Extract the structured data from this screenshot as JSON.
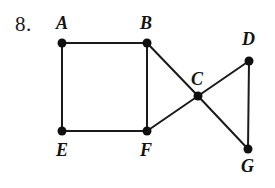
{
  "figure": {
    "width": 275,
    "height": 188,
    "background_color": "#ffffff",
    "ink_color": "#1a1a1a",
    "problem_number": "8."
  },
  "graph": {
    "edge_color": "#1a1a1a",
    "edge_width": 2,
    "vertex_color": "#101010",
    "vertex_radius": 4.5,
    "vertices": [
      {
        "id": "A",
        "label": "A",
        "x": 62,
        "y": 43,
        "label_x": 56,
        "label_y": 14
      },
      {
        "id": "B",
        "label": "B",
        "x": 147,
        "y": 43,
        "label_x": 140,
        "label_y": 14
      },
      {
        "id": "C",
        "label": "C",
        "x": 198,
        "y": 96,
        "label_x": 191,
        "label_y": 70
      },
      {
        "id": "D",
        "label": "D",
        "x": 249,
        "y": 61,
        "label_x": 242,
        "label_y": 30
      },
      {
        "id": "E",
        "label": "E",
        "x": 62,
        "y": 131,
        "label_x": 56,
        "label_y": 141
      },
      {
        "id": "F",
        "label": "F",
        "x": 147,
        "y": 131,
        "label_x": 140,
        "label_y": 141
      },
      {
        "id": "G",
        "label": "G",
        "x": 248,
        "y": 149,
        "label_x": 241,
        "label_y": 157
      }
    ],
    "edges": [
      {
        "from": "A",
        "to": "B"
      },
      {
        "from": "A",
        "to": "E"
      },
      {
        "from": "E",
        "to": "F"
      },
      {
        "from": "B",
        "to": "F"
      },
      {
        "from": "B",
        "to": "C"
      },
      {
        "from": "C",
        "to": "F"
      },
      {
        "from": "C",
        "to": "D"
      },
      {
        "from": "C",
        "to": "G"
      },
      {
        "from": "D",
        "to": "G"
      }
    ]
  }
}
